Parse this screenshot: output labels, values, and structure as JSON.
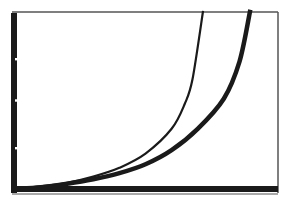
{
  "device": "graphing-calculator-screen",
  "chart_data": {
    "type": "line",
    "title": "",
    "xlabel": "",
    "ylabel": "",
    "grid": false,
    "legend": "none",
    "xlim": [
      0,
      10
    ],
    "ylim": [
      0,
      10
    ],
    "y_ticks": [
      0,
      5,
      10
    ],
    "series": [
      {
        "name": "curve-thin",
        "style": "thin",
        "x": [
          0,
          1,
          2,
          3,
          4,
          5,
          6,
          6.5,
          6.8,
          7.2
        ],
        "y": [
          0.0,
          0.15,
          0.35,
          0.7,
          1.2,
          2.0,
          3.4,
          4.8,
          6.2,
          10.0
        ]
      },
      {
        "name": "curve-thick",
        "style": "thick",
        "x": [
          0,
          1,
          2,
          3,
          4,
          5,
          6,
          7,
          8,
          8.6,
          9.0
        ],
        "y": [
          0.0,
          0.1,
          0.3,
          0.55,
          0.9,
          1.4,
          2.2,
          3.4,
          5.1,
          7.2,
          10.0
        ]
      }
    ]
  },
  "colors": {
    "background": "#ffffff",
    "ink": "#1a1a1a",
    "frame": "#555555"
  }
}
